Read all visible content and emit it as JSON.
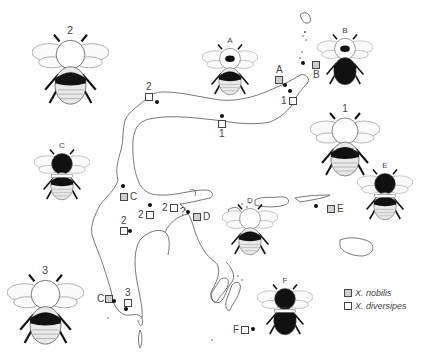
{
  "figure": {
    "type": "distribution map with bee color-form illustrations",
    "legend": [
      {
        "symbol": "grey-square",
        "label": "X. nobilis"
      },
      {
        "symbol": "white-square",
        "label": "X. diversipes"
      }
    ],
    "bees": [
      {
        "label": "2",
        "x": 70,
        "y": 70,
        "size": 1.1,
        "pattern": "black-thorax-band"
      },
      {
        "label": "A",
        "x": 230,
        "y": 70,
        "size": 0.8,
        "pattern": "dark-patch"
      },
      {
        "label": "B",
        "x": 345,
        "y": 60,
        "size": 0.8,
        "pattern": "all-dark-abdomen"
      },
      {
        "label": "1",
        "x": 345,
        "y": 145,
        "size": 1.0,
        "pattern": "black-band-striped"
      },
      {
        "label": "C",
        "x": 62,
        "y": 175,
        "size": 0.8,
        "pattern": "black-white-band"
      },
      {
        "label": "D",
        "x": 250,
        "y": 230,
        "size": 0.8,
        "pattern": "black-band-striped"
      },
      {
        "label": "E",
        "x": 385,
        "y": 195,
        "size": 0.8,
        "pattern": "black-white-band"
      },
      {
        "label": "F",
        "x": 285,
        "y": 310,
        "size": 0.8,
        "pattern": "black-white-black"
      },
      {
        "label": "3",
        "x": 45,
        "y": 310,
        "size": 1.1,
        "pattern": "black-band-striped"
      }
    ],
    "markers": [
      {
        "label": "2",
        "type": "diversipes",
        "x": 145,
        "y": 93,
        "label_pos": "top",
        "dot": {
          "x": 157,
          "y": 102
        }
      },
      {
        "label": "A",
        "type": "nobilis",
        "x": 275,
        "y": 76,
        "label_pos": "top",
        "dot": {
          "x": 285,
          "y": 85
        }
      },
      {
        "label": "B",
        "type": "nobilis",
        "x": 312,
        "y": 61,
        "label_pos": "bottom",
        "dot": {
          "x": 303,
          "y": 63
        }
      },
      {
        "label": "1",
        "type": "diversipes",
        "x": 289,
        "y": 97,
        "label_pos": "left",
        "dot": {
          "x": 290,
          "y": 91
        }
      },
      {
        "label": "1",
        "type": "diversipes",
        "x": 218,
        "y": 120,
        "label_pos": "bottom",
        "dot": {
          "x": 222,
          "y": 116
        }
      },
      {
        "label": "C",
        "type": "nobilis",
        "x": 120,
        "y": 193,
        "label_pos": "right",
        "dot": {
          "x": 123,
          "y": 186
        }
      },
      {
        "label": "2",
        "type": "diversipes",
        "x": 146,
        "y": 211,
        "label_pos": "left",
        "dot": {
          "x": 150,
          "y": 205
        }
      },
      {
        "label": "2",
        "type": "diversipes",
        "x": 120,
        "y": 227,
        "label_pos": "top",
        "dot": {
          "x": 130,
          "y": 231
        }
      },
      {
        "label": "2",
        "type": "diversipes",
        "x": 170,
        "y": 204,
        "label_pos": "left",
        "dot": {
          "x": 188,
          "y": 212
        }
      },
      {
        "label": "D",
        "type": "nobilis",
        "x": 193,
        "y": 213,
        "label_pos": "right",
        "dot": null
      },
      {
        "label": "E",
        "type": "nobilis",
        "x": 327,
        "y": 205,
        "label_pos": "right",
        "dot": {
          "x": 316,
          "y": 206
        }
      },
      {
        "label": "C",
        "type": "nobilis",
        "x": 105,
        "y": 295,
        "label_pos": "left",
        "dot": {
          "x": 114,
          "y": 301
        }
      },
      {
        "label": "3",
        "type": "diversipes",
        "x": 124,
        "y": 299,
        "label_pos": "top",
        "dot": {
          "x": 126,
          "y": 309
        }
      },
      {
        "label": "F",
        "type": "diversipes",
        "x": 241,
        "y": 326,
        "label_pos": "left",
        "dot": {
          "x": 253,
          "y": 329
        }
      }
    ],
    "question_marks": [
      {
        "text": "?",
        "x": 180,
        "y": 207
      }
    ]
  }
}
